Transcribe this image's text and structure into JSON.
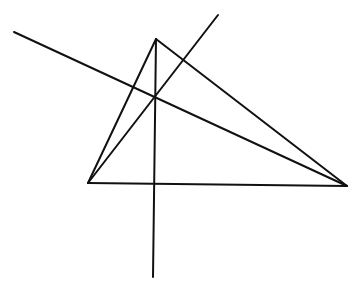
{
  "diagram": {
    "type": "geometry",
    "stroke_color": "#111111",
    "background": "#ffffff",
    "vertices": {
      "A": [
        156,
        39
      ],
      "B": [
        88,
        183
      ],
      "C": [
        347,
        186
      ]
    },
    "triangle_edges": [
      {
        "from": [
          156,
          39
        ],
        "to": [
          88,
          183
        ]
      },
      {
        "from": [
          88,
          183
        ],
        "to": [
          347,
          186
        ]
      },
      {
        "from": [
          347,
          186
        ],
        "to": [
          156,
          39
        ]
      }
    ],
    "lines": [
      {
        "name": "altitude-from-a",
        "from": [
          156,
          39
        ],
        "to": [
          153,
          277
        ]
      },
      {
        "name": "altitude-from-b",
        "from": [
          88,
          183
        ],
        "to": [
          218,
          15
        ]
      },
      {
        "name": "altitude-from-c",
        "from": [
          14,
          32
        ],
        "to": [
          347,
          186
        ]
      }
    ],
    "concurrency_point": [
      155,
      97
    ]
  }
}
